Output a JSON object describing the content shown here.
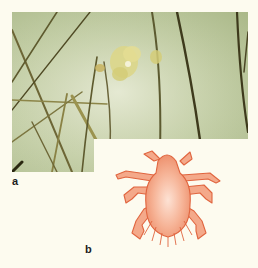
{
  "figure": {
    "panels": [
      {
        "label": "a",
        "content": "photograph of hair shafts with attached nits on skin"
      },
      {
        "label": "b",
        "content": "illustration of pubic louse"
      }
    ]
  },
  "colors": {
    "page_background": "#fdfbef",
    "skin": "#c9d3ae",
    "hair": "#5e5a2e",
    "nits": "#d8d27a",
    "louse_fill": "#f4a98a",
    "louse_outline": "#e0653f"
  }
}
